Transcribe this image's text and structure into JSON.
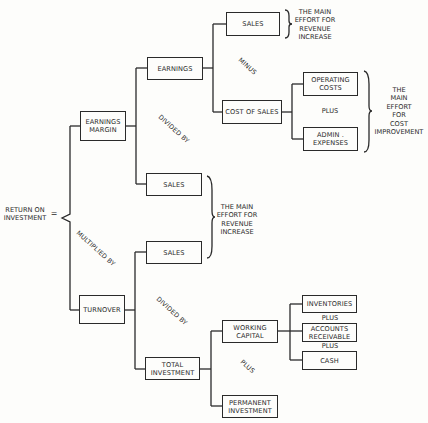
{
  "root": {
    "label": "RETURN ON\nINVESTMENT",
    "equals": "="
  },
  "nodes": {
    "earnings_margin": "EARNINGS\nMARGIN",
    "earnings": "EARNINGS",
    "sales_top": "SALES",
    "cost_of_sales": "COST OF SALES",
    "operating_costs": "OPERATING\nCOSTS",
    "admin_expenses": "ADMIN .\nEXPENSES",
    "sales_margin_divisor": "SALES",
    "sales_turnover": "SALES",
    "turnover": "TURNOVER",
    "total_investment": "TOTAL\nINVESTMENT",
    "working_capital": "WORKING\nCAPITAL",
    "permanent_investment": "PERMANENT\nINVESTMENT",
    "inventories": "INVENTORIES",
    "accounts_receivable": "ACCOUNTS\nRECEIVABLE",
    "cash": "CASH"
  },
  "operators": {
    "multiplied_by": "MULTIPLIED BY",
    "divided_by_margin": "DIVIDED BY",
    "divided_by_turnover": "DIVIDED BY",
    "minus": "MINUS",
    "plus_costs": "PLUS",
    "plus_investment": "PLUS",
    "plus_inventories": "PLUS",
    "plus_receivables": "PLUS"
  },
  "annotations": {
    "revenue_top": "THE MAIN\nEFFORT FOR\nREVENUE\nINCREASE",
    "cost_improvement": "THE\nMAIN\nEFFORT\nFOR\nCOST\nIMPROVEMENT",
    "revenue_mid": "THE MAIN\nEFFORT FOR\nREVENUE\nINCREASE"
  }
}
